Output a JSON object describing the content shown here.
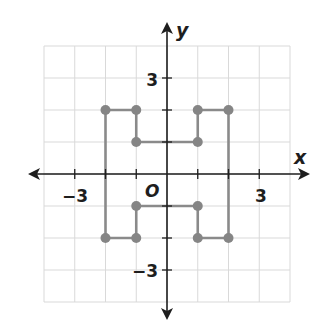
{
  "diagram": {
    "type": "coordinate-plane",
    "axes": {
      "x_label": "x",
      "y_label": "y",
      "origin_label": "O",
      "x_ticks": {
        "-3": "−3",
        "3": "3"
      },
      "y_ticks": {
        "3": "3",
        "-3": "−3"
      },
      "x_range": [
        -4,
        4
      ],
      "y_range": [
        -4,
        4
      ],
      "grid": true
    },
    "shape": {
      "name": "H-shaped polygon",
      "closed": true,
      "vertices": [
        [
          -2,
          2
        ],
        [
          -1,
          2
        ],
        [
          -1,
          1
        ],
        [
          1,
          1
        ],
        [
          1,
          2
        ],
        [
          2,
          2
        ],
        [
          2,
          -2
        ],
        [
          1,
          -2
        ],
        [
          1,
          -1
        ],
        [
          -1,
          -1
        ],
        [
          -1,
          -2
        ],
        [
          -2,
          -2
        ]
      ],
      "stroke_color": "#8a8a8a",
      "vertex_color": "#858585"
    },
    "colors": {
      "axis": "#1e1e1e",
      "grid": "#d9d9d9",
      "background": "#ffffff"
    }
  }
}
